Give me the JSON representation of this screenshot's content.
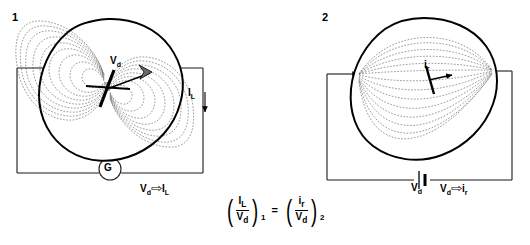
{
  "figure": {
    "background_color": "#ffffff",
    "line_color": "#000000",
    "field_line_color": "#555555"
  },
  "panels": [
    {
      "number": "1",
      "description": "Lead field: dipole source inside volume conductor, galvanometer measures lead voltage",
      "labels": {
        "dipole": "V",
        "dipole_sub": "d",
        "output_current": "I",
        "output_current_sub": "L",
        "meter": "G",
        "relation_from": "V",
        "relation_from_sub": "d",
        "relation_arrow": "⇨",
        "relation_to": "I",
        "relation_to_sub": "L"
      },
      "icons": [
        "dipole-arrow-icon",
        "current-down-arrow-icon",
        "galvanometer-icon"
      ]
    },
    {
      "number": "2",
      "description": "Current flow field: battery drives current through volume conductor, reciprocal dipole response",
      "labels": {
        "dipole": "i",
        "dipole_sub": "r",
        "battery": "V",
        "battery_sub": "d",
        "relation_from": "V",
        "relation_from_sub": "d",
        "relation_arrow": "⇨",
        "relation_to": "i",
        "relation_to_sub": "r"
      },
      "icons": [
        "current-in-arrow-icon",
        "reciprocal-dipole-arrow-icon",
        "battery-icon"
      ]
    }
  ],
  "equation": {
    "left": {
      "numerator": "I",
      "numerator_sub": "L",
      "denominator": "V",
      "denominator_sub": "d",
      "index": "1"
    },
    "operator": "=",
    "right": {
      "numerator": "i",
      "numerator_sub": "r",
      "denominator": "V",
      "denominator_sub": "d",
      "index": "2"
    }
  },
  "geometry": {
    "panel1": {
      "circuit_rect": {
        "x": 17,
        "y": 68,
        "w": 186,
        "h": 105
      },
      "body_center": {
        "x": 108,
        "y": 92
      },
      "dipole_center": {
        "x": 107,
        "y": 88
      },
      "galvanometer": {
        "cx": 110,
        "cy": 169,
        "r": 11
      }
    },
    "panel2": {
      "circuit_rect": {
        "x": 327,
        "y": 70,
        "w": 185,
        "h": 110
      },
      "body_center": {
        "x": 418,
        "y": 92
      },
      "electrode_left": {
        "x": 359,
        "y": 74
      },
      "electrode_right": {
        "x": 492,
        "y": 70
      },
      "battery": {
        "x": 422,
        "y": 180
      }
    }
  }
}
